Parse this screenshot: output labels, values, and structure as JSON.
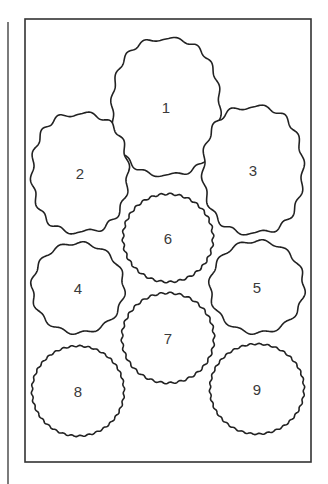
{
  "diagram": {
    "type": "cookie-cutter-layout",
    "colors": {
      "stroke": "#222222",
      "background": "#ffffff",
      "label": "#3a3a3a"
    },
    "frame": {
      "x": 25,
      "y": 19,
      "width": 286,
      "height": 443
    },
    "margin_line": {
      "x": 8,
      "y1": 22,
      "y2": 484
    },
    "shapes": [
      {
        "id": "1",
        "label": "1",
        "kind": "oval-pointed",
        "cx": 166,
        "cy": 107,
        "rx": 54,
        "ry": 68,
        "waves": 16,
        "amp": 1.8
      },
      {
        "id": "2",
        "label": "2",
        "kind": "oval-pointed",
        "cx": 80,
        "cy": 173,
        "rx": 48,
        "ry": 59,
        "waves": 14,
        "amp": 2.2
      },
      {
        "id": "3",
        "label": "3",
        "kind": "oval-pointed",
        "cx": 253,
        "cy": 170,
        "rx": 50,
        "ry": 63,
        "waves": 14,
        "amp": 2.2
      },
      {
        "id": "4",
        "label": "4",
        "kind": "round",
        "cx": 78,
        "cy": 288,
        "rx": 46,
        "ry": 45,
        "waves": 12,
        "amp": 1.6
      },
      {
        "id": "5",
        "label": "5",
        "kind": "round",
        "cx": 257,
        "cy": 287,
        "rx": 47,
        "ry": 46,
        "waves": 12,
        "amp": 1.6
      },
      {
        "id": "6",
        "label": "6",
        "kind": "round",
        "cx": 168,
        "cy": 238,
        "rx": 45,
        "ry": 44,
        "waves": 30,
        "amp": 0.9
      },
      {
        "id": "7",
        "label": "7",
        "kind": "round",
        "cx": 168,
        "cy": 338,
        "rx": 46,
        "ry": 45,
        "waves": 30,
        "amp": 0.9
      },
      {
        "id": "8",
        "label": "8",
        "kind": "round",
        "cx": 78,
        "cy": 391,
        "rx": 46,
        "ry": 45,
        "waves": 34,
        "amp": 0.7
      },
      {
        "id": "9",
        "label": "9",
        "kind": "round",
        "cx": 257,
        "cy": 389,
        "rx": 47,
        "ry": 45,
        "waves": 34,
        "amp": 0.7
      }
    ]
  }
}
